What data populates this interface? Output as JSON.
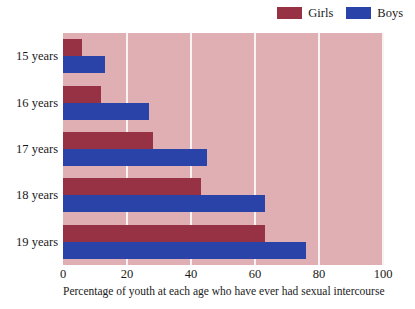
{
  "chart_data": {
    "type": "bar",
    "orientation": "horizontal",
    "title": "",
    "xlabel": "Percentage of youth at each age who have ever had sexual intercourse",
    "ylabel": "",
    "categories": [
      "15 years",
      "16 years",
      "17 years",
      "18 years",
      "19 years"
    ],
    "series": [
      {
        "name": "Girls",
        "color": "#963243",
        "values": [
          6,
          12,
          28,
          43,
          63
        ]
      },
      {
        "name": "Boys",
        "color": "#2943a8",
        "values": [
          13,
          27,
          45,
          63,
          76
        ]
      }
    ],
    "xlim": [
      0,
      100
    ],
    "xticks": [
      0,
      20,
      40,
      60,
      80,
      100
    ],
    "xtick_labels": [
      "0",
      "20",
      "40",
      "60",
      "80",
      "100"
    ],
    "grid": true,
    "grid_color": "#fbf2f3",
    "plot_background": "#e0afb4",
    "legend_position": "top-right"
  },
  "legend": {
    "entries": [
      {
        "label": "Girls",
        "color": "#963243"
      },
      {
        "label": "Boys",
        "color": "#2943a8"
      }
    ]
  },
  "axis": {
    "x_title": "Percentage of youth at each age who have ever had sexual intercourse",
    "x_ticks": [
      "0",
      "20",
      "40",
      "60",
      "80",
      "100"
    ],
    "y_ticks": [
      "15 years",
      "16 years",
      "17 years",
      "18 years",
      "19 years"
    ]
  }
}
